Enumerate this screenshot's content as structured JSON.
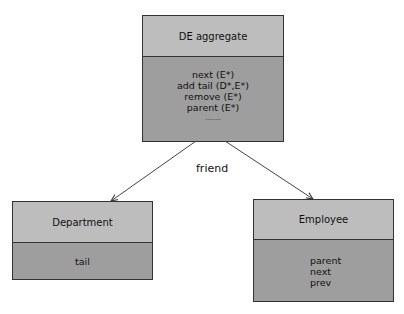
{
  "diagram": {
    "aggregate": {
      "title": "DE aggregate",
      "methods": [
        "next (E*)",
        "add tail (D*,E*)",
        "remove (E*)",
        "parent (E*)",
        "........"
      ]
    },
    "relation_label": "friend",
    "department": {
      "title": "Department",
      "members": [
        "tail"
      ]
    },
    "employee": {
      "title": "Employee",
      "members": [
        "parent",
        "next",
        "prev"
      ]
    }
  }
}
